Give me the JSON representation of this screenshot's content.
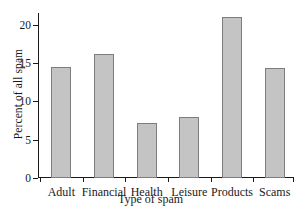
{
  "chart_data": {
    "type": "bar",
    "title": "",
    "xlabel": "Type of spam",
    "ylabel": "Percent of all spam",
    "categories": [
      "Adult",
      "Financial",
      "Health",
      "Leisure",
      "Products",
      "Scams"
    ],
    "values": [
      14.5,
      16.2,
      7.2,
      7.9,
      21.0,
      14.3
    ],
    "ylim": [
      0,
      21.5
    ],
    "yticks": [
      0,
      5,
      10,
      15,
      20
    ],
    "ytick_labels": [
      "0",
      "5",
      "10",
      "15",
      "20"
    ],
    "grid": false,
    "legend": false,
    "legend_position": "none",
    "colors": {
      "bar_fill": "#c4c4c4",
      "bar_edge": "#7d7d7d",
      "axis": "#1a1a1a",
      "background": "#ffffff",
      "text": "#1a1a1a"
    }
  }
}
